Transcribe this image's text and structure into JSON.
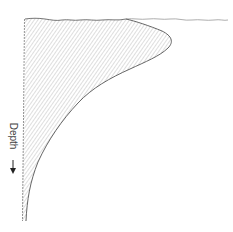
{
  "diagram": {
    "label": "Depth",
    "arrow_direction": "down",
    "colors": {
      "fill_hatch": "#bdbdbd",
      "outline": "#555555",
      "surface_line": "#888888",
      "background": "#ffffff"
    }
  }
}
